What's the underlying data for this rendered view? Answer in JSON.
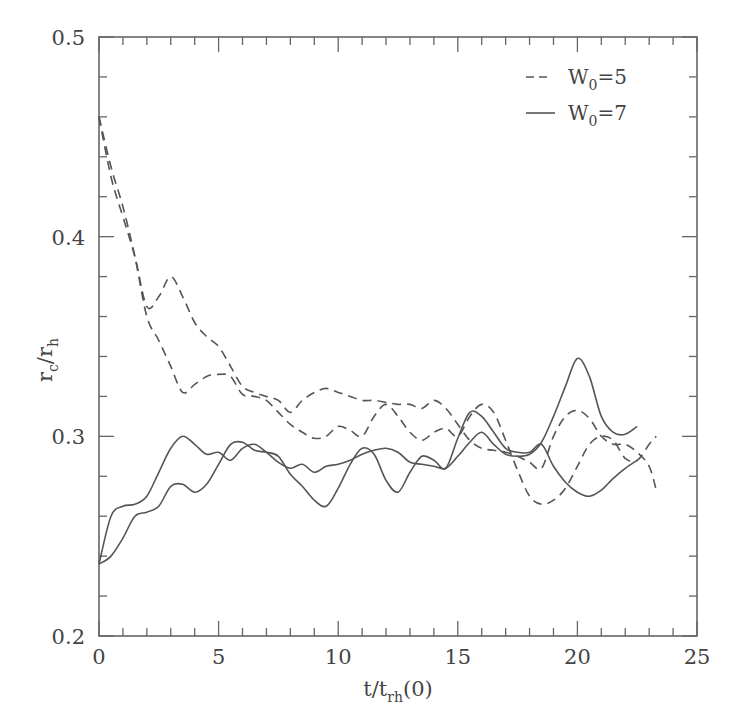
{
  "chart_data": {
    "type": "line",
    "title": "",
    "xlabel": "t/t_rh(0)",
    "ylabel": "r_c/r_h",
    "xlim": [
      0,
      25
    ],
    "ylim": [
      0.2,
      0.5
    ],
    "x_ticks": [
      0,
      5,
      10,
      15,
      20,
      25
    ],
    "y_ticks": [
      0.2,
      0.3,
      0.4,
      0.5
    ],
    "x_tick_labels": [
      "0",
      "5",
      "10",
      "15",
      "20",
      "25"
    ],
    "y_tick_labels": [
      "0.2",
      "0.3",
      "0.4",
      "0.5"
    ],
    "grid": false,
    "legend_position": "upper right",
    "legend": [
      {
        "label_main": "W",
        "label_sub": "0",
        "label_rest": "=5",
        "style": "dashed"
      },
      {
        "label_main": "W",
        "label_sub": "0",
        "label_rest": "=7",
        "style": "solid"
      }
    ],
    "series": [
      {
        "name": "W0=5 (run a)",
        "style": "dashed",
        "x": [
          0,
          0.5,
          1,
          1.5,
          2,
          2.5,
          3,
          3.5,
          4,
          4.5,
          5,
          5.5,
          6,
          6.5,
          7,
          7.5,
          8,
          8.5,
          9,
          9.5,
          10,
          10.5,
          11,
          11.5,
          12,
          12.5,
          13,
          13.5,
          14,
          14.5,
          15,
          15.5,
          16,
          16.5,
          17,
          17.5,
          18,
          18.5,
          19,
          19.5,
          20,
          20.5,
          21,
          21.5,
          22,
          22.5,
          23,
          23.3
        ],
        "y": [
          0.46,
          0.43,
          0.41,
          0.39,
          0.365,
          0.37,
          0.38,
          0.37,
          0.357,
          0.35,
          0.345,
          0.335,
          0.325,
          0.322,
          0.32,
          0.318,
          0.312,
          0.318,
          0.322,
          0.324,
          0.322,
          0.32,
          0.318,
          0.318,
          0.317,
          0.316,
          0.316,
          0.314,
          0.318,
          0.314,
          0.306,
          0.298,
          0.294,
          0.293,
          0.292,
          0.29,
          0.287,
          0.284,
          0.3,
          0.31,
          0.313,
          0.309,
          0.3,
          0.296,
          0.296,
          0.292,
          0.285,
          0.273
        ]
      },
      {
        "name": "W0=5 (run b)",
        "style": "dashed",
        "x": [
          0,
          0.5,
          1,
          1.5,
          2,
          2.5,
          3,
          3.5,
          4,
          4.5,
          5,
          5.5,
          6,
          6.5,
          7,
          7.5,
          8,
          8.5,
          9,
          9.5,
          10,
          10.5,
          11,
          11.5,
          12,
          12.5,
          13,
          13.5,
          14,
          14.5,
          15,
          15.5,
          16,
          16.5,
          17,
          17.5,
          18,
          18.5,
          19,
          19.5,
          20,
          20.5,
          21,
          21.5,
          22,
          22.5,
          23,
          23.3
        ],
        "y": [
          0.46,
          0.435,
          0.415,
          0.39,
          0.36,
          0.348,
          0.335,
          0.322,
          0.326,
          0.33,
          0.331,
          0.33,
          0.321,
          0.32,
          0.318,
          0.312,
          0.306,
          0.302,
          0.299,
          0.3,
          0.305,
          0.303,
          0.3,
          0.31,
          0.316,
          0.31,
          0.302,
          0.298,
          0.302,
          0.304,
          0.3,
          0.31,
          0.316,
          0.312,
          0.298,
          0.283,
          0.27,
          0.266,
          0.268,
          0.274,
          0.285,
          0.296,
          0.3,
          0.298,
          0.289,
          0.288,
          0.296,
          0.3
        ]
      },
      {
        "name": "W0=7 (run a)",
        "style": "solid",
        "x": [
          0,
          0.5,
          1,
          1.5,
          2,
          2.5,
          3,
          3.5,
          4,
          4.5,
          5,
          5.5,
          6,
          6.5,
          7,
          7.5,
          8,
          8.5,
          9,
          9.5,
          10,
          10.5,
          11,
          11.5,
          12,
          12.5,
          13,
          13.5,
          14,
          14.5,
          15,
          15.5,
          16,
          16.5,
          17,
          17.5,
          18,
          18.5,
          19,
          19.5,
          20,
          20.5,
          21,
          21.5,
          22,
          22.5
        ],
        "y": [
          0.236,
          0.26,
          0.265,
          0.266,
          0.27,
          0.282,
          0.294,
          0.3,
          0.296,
          0.291,
          0.292,
          0.288,
          0.294,
          0.296,
          0.292,
          0.287,
          0.284,
          0.286,
          0.282,
          0.285,
          0.286,
          0.288,
          0.291,
          0.293,
          0.294,
          0.292,
          0.287,
          0.286,
          0.285,
          0.284,
          0.29,
          0.297,
          0.302,
          0.296,
          0.291,
          0.29,
          0.291,
          0.297,
          0.31,
          0.325,
          0.339,
          0.33,
          0.31,
          0.302,
          0.301,
          0.305
        ]
      },
      {
        "name": "W0=7 (run b)",
        "style": "solid",
        "x": [
          0,
          0.5,
          1,
          1.5,
          2,
          2.5,
          3,
          3.5,
          4,
          4.5,
          5,
          5.5,
          6,
          6.5,
          7,
          7.5,
          8,
          8.5,
          9,
          9.5,
          10,
          10.5,
          11,
          11.5,
          12,
          12.5,
          13,
          13.5,
          14,
          14.5,
          15,
          15.5,
          16,
          16.5,
          17,
          17.5,
          18,
          18.5,
          19,
          19.5,
          20,
          20.5,
          21,
          21.5,
          22,
          22.5
        ],
        "y": [
          0.236,
          0.24,
          0.249,
          0.26,
          0.262,
          0.265,
          0.275,
          0.276,
          0.272,
          0.276,
          0.286,
          0.296,
          0.297,
          0.293,
          0.292,
          0.29,
          0.281,
          0.275,
          0.268,
          0.265,
          0.274,
          0.286,
          0.294,
          0.291,
          0.278,
          0.272,
          0.282,
          0.29,
          0.288,
          0.284,
          0.299,
          0.312,
          0.31,
          0.302,
          0.294,
          0.292,
          0.292,
          0.296,
          0.285,
          0.277,
          0.272,
          0.27,
          0.273,
          0.279,
          0.284,
          0.288
        ]
      }
    ]
  }
}
